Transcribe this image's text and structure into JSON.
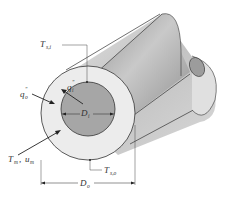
{
  "diagram": {
    "labels": {
      "T_si": {
        "main": "T",
        "sub": "s,i"
      },
      "q_i": {
        "main": "q",
        "sup": "″",
        "sub": "i"
      },
      "q_o": {
        "main": "q",
        "sup": "″",
        "sub": "o"
      },
      "D_i": {
        "main": "D",
        "sub": "i"
      },
      "T_m": {
        "main": "T",
        "sub": "m"
      },
      "u_m": {
        "main": "u",
        "sub": "m"
      },
      "T_so": {
        "main": "T",
        "sub": "s,o"
      },
      "D_o": {
        "main": "D",
        "sub": "o"
      },
      "sep": ","
    },
    "colors": {
      "outer_tube": "#d4d4d4",
      "inner_tube": "#9a9a9a",
      "annulus_face": "#ebebeb",
      "inner_face": "#a8a8a8",
      "stroke": "#333333"
    }
  }
}
